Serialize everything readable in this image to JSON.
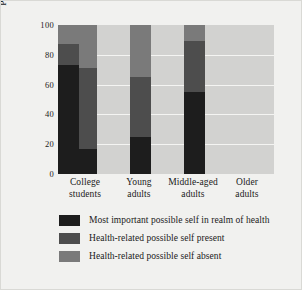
{
  "chart_data": {
    "type": "bar",
    "stacked": true,
    "title": "",
    "xlabel": "",
    "ylabel": "Percentage of sample",
    "ylim": [
      0,
      100
    ],
    "yticks": [
      0,
      20,
      40,
      60,
      80,
      100
    ],
    "ytick_labels": [
      "0",
      "20",
      "40",
      "60",
      "80",
      "100"
    ],
    "grid": true,
    "legend_position": "below-plot",
    "categories": [
      "College students",
      "Young adults",
      "Middle-aged adults",
      "Older adults"
    ],
    "category_lines": [
      [
        "College",
        "students"
      ],
      [
        "Young",
        "adults"
      ],
      [
        "Middle-aged",
        "adults"
      ],
      [
        "Older",
        "adults"
      ]
    ],
    "series": [
      {
        "name": "Most important possible self in realm of health",
        "color": "#1d1d1d",
        "values": [
          17,
          25,
          55,
          73
        ]
      },
      {
        "name": "Health-related possible self present",
        "color": "#4d4d4d",
        "values": [
          54,
          40,
          34,
          14
        ]
      },
      {
        "name": "Health-related possible self absent",
        "color": "#7a7a7a",
        "values": [
          29,
          35,
          11,
          13
        ]
      }
    ],
    "cumulative_tops": [
      [
        17,
        71,
        100
      ],
      [
        25,
        65,
        100
      ],
      [
        55,
        89,
        100
      ],
      [
        73,
        87,
        100
      ]
    ]
  },
  "legend": {
    "items": [
      {
        "label": "Most important possible self in realm of health",
        "swatch": "#1d1d1d"
      },
      {
        "label": "Health-related possible self present",
        "swatch": "#4d4d4d"
      },
      {
        "label": "Health-related possible self absent",
        "swatch": "#7a7a7a"
      }
    ]
  },
  "colors": {
    "figure_background": "#f1f1ef",
    "plot_background": "#d2d2d0",
    "gridline": "#f4f4f2",
    "text": "#1a1a1a"
  }
}
